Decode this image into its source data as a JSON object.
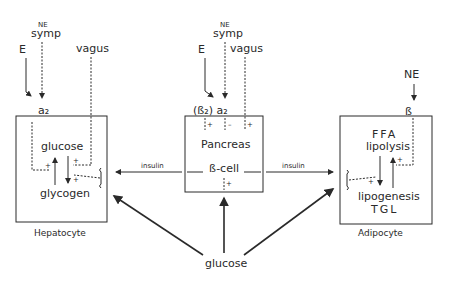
{
  "diagram": {
    "inputs": {
      "hepatocyte": {
        "E": "E",
        "NE": "NE",
        "symp": "symp",
        "vagus": "vagus",
        "receptor": "a₂"
      },
      "pancreas": {
        "E": "E",
        "NE": "NE",
        "symp": "symp",
        "vagus": "vagus",
        "receptors": "(ß₂) a₂"
      },
      "adipocyte": {
        "NE": "NE",
        "receptor": "ß"
      }
    },
    "hepatocyte": {
      "label": "Hepatocyte",
      "top": "glucose",
      "bottom": "glycogen",
      "signs": [
        "+",
        "+",
        "+"
      ]
    },
    "pancreas": {
      "label": "Pancreas",
      "cell": "ß-cell",
      "signs": [
        "+",
        "–",
        "+",
        "+"
      ]
    },
    "adipocyte": {
      "label": "Adipocyte",
      "top1": "FFA",
      "top2": "lipolysis",
      "bottom1": "lipogenesis",
      "bottom2": "TGL",
      "signs": [
        "+",
        "+"
      ]
    },
    "links": {
      "insulin_left": "insulin",
      "insulin_right": "insulin"
    },
    "source": "glucose",
    "colors": {
      "line": "#2a2a2a",
      "background": "#ffffff"
    }
  }
}
